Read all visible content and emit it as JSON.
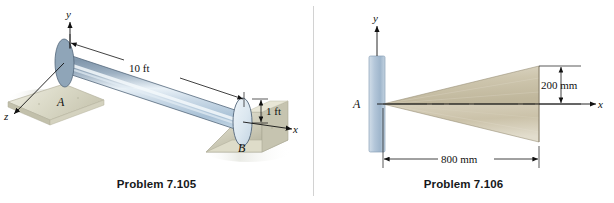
{
  "sheet": {
    "figure_count": 2,
    "background_color": "#ffffff",
    "divider_color": "#d2d2d2"
  },
  "figures": [
    {
      "id": "problem-7-105",
      "caption": "Problem 7.105",
      "object": "cylinder",
      "object_colors": {
        "body_dark": "#7f94a8",
        "body_mid": "#b9cbdb",
        "body_highlight": "#eef4f8",
        "end_cap": "#dce7ef",
        "outline": "#3d4d5c"
      },
      "support_color": "#cfcdba",
      "axes": [
        {
          "name": "y",
          "label": "y"
        },
        {
          "name": "x",
          "label": "x"
        },
        {
          "name": "z",
          "label": "z"
        }
      ],
      "points": [
        {
          "name": "A",
          "label": "A"
        },
        {
          "name": "B",
          "label": "B"
        }
      ],
      "dimensions": [
        {
          "name": "length",
          "label": "10 ft",
          "value": 10,
          "unit": "ft"
        },
        {
          "name": "radius",
          "label": "1 ft",
          "value": 1,
          "unit": "ft"
        }
      ]
    },
    {
      "id": "problem-7-106",
      "caption": "Problem 7.106",
      "object": "cone",
      "object_colors": {
        "cone_light": "#e4ded0",
        "cone_mid": "#cfc7b0",
        "cone_dark": "#bdb49c",
        "outline": "#8d856f"
      },
      "wall_colors": {
        "light": "#c8d6e4",
        "mid": "#a9bed2",
        "outline": "#8ba2b8"
      },
      "axes": [
        {
          "name": "y",
          "label": "y"
        },
        {
          "name": "x",
          "label": "x"
        }
      ],
      "points": [
        {
          "name": "A",
          "label": "A"
        }
      ],
      "dimensions": [
        {
          "name": "base-radius",
          "label": "200 mm",
          "value": 200,
          "unit": "mm"
        },
        {
          "name": "height",
          "label": "800 mm",
          "value": 800,
          "unit": "mm"
        }
      ]
    }
  ]
}
